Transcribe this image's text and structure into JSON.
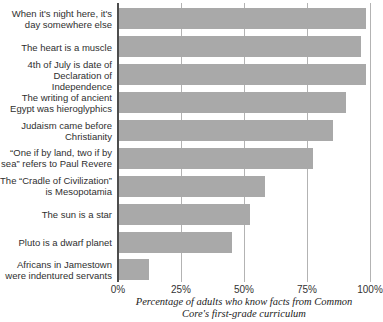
{
  "chart_data": {
    "type": "bar",
    "orientation": "horizontal",
    "title": "",
    "categories": [
      "When it's night here, it's day somewhere else",
      "The heart is a muscle",
      "4th of July is date of Declaration of Independence",
      "The writing of ancient Egypt was hieroglyphics",
      "Judaism came before Christianity",
      "“One if by land, two if by sea” refers to Paul Revere",
      "The “Cradle of Civilization” is Mesopotamia",
      "The sun is a star",
      "Pluto is a dwarf planet",
      "Africans in Jamestown were indentured servants"
    ],
    "values": [
      98,
      96,
      98,
      90,
      85,
      77,
      58,
      52,
      45,
      12
    ],
    "xlabel": "Percentage of adults who know facts from Common Core's first-grade curriculum",
    "xlabel_lines": [
      "Percentage of adults who know facts from Common",
      "Core's first-grade curriculum"
    ],
    "ylabel": "",
    "xlim": [
      0,
      100
    ],
    "tick_labels": [
      "0%",
      "25%",
      "50%",
      "75%",
      "100%"
    ],
    "tick_values": [
      0,
      25,
      50,
      75,
      100
    ],
    "grid": true,
    "legend": false,
    "colors": {
      "bar": "#a9a9a9",
      "axis": "#4d4d4d",
      "gridline": "#b3b3b3",
      "label_text": "#2f2f2f",
      "tick_text": "#333333",
      "caption_text": "#222222",
      "background": "#ffffff"
    }
  }
}
